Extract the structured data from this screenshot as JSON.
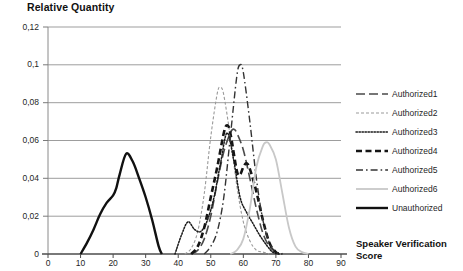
{
  "chart_data": {
    "type": "line",
    "title": "",
    "ylabel": "Relative Quantity",
    "xlabel": "Speaker Verification Score",
    "xlabel_line1": "Speaker Verification",
    "xlabel_line2": "Score",
    "xlim": [
      0,
      90
    ],
    "ylim": [
      0,
      0.12
    ],
    "xticks": [
      "0",
      "10",
      "20",
      "30",
      "40",
      "50",
      "60",
      "70",
      "80",
      "90"
    ],
    "xtick_values": [
      0,
      10,
      20,
      30,
      40,
      50,
      60,
      70,
      80,
      90
    ],
    "yticks": [
      "0",
      "0,02",
      "0,04",
      "0,06",
      "0,08",
      "0,1",
      "0,12"
    ],
    "ytick_values": [
      0,
      0.02,
      0.04,
      0.06,
      0.08,
      0.1,
      0.12
    ],
    "grid": "horizontal",
    "legend_position": "right",
    "decimal_separator": ",",
    "series": [
      {
        "name": "Authorized1",
        "style": "long-dash",
        "color": "#4a4a4a",
        "width": 1.6,
        "peak_x": 57,
        "peak_y": 0.066,
        "x": [
          44,
          46,
          48,
          50,
          52,
          54,
          56,
          57,
          58,
          60,
          62,
          64,
          66,
          68,
          70,
          72
        ],
        "y": [
          0.0,
          0.002,
          0.008,
          0.02,
          0.038,
          0.054,
          0.064,
          0.066,
          0.064,
          0.055,
          0.04,
          0.024,
          0.011,
          0.004,
          0.001,
          0.0
        ]
      },
      {
        "name": "Authorized2",
        "style": "fine-dash",
        "color": "#9a9a9a",
        "width": 1.1,
        "peak_x": 53,
        "peak_y": 0.088,
        "x": [
          42,
          44,
          46,
          48,
          50,
          52,
          53,
          54,
          56,
          58,
          60,
          62,
          64,
          66,
          68
        ],
        "y": [
          0.0,
          0.003,
          0.012,
          0.032,
          0.062,
          0.085,
          0.088,
          0.084,
          0.062,
          0.036,
          0.017,
          0.007,
          0.002,
          0.001,
          0.0
        ]
      },
      {
        "name": "Authorized3",
        "style": "dotted",
        "color": "#1a1a1a",
        "width": 1.5,
        "peak_x": 55,
        "peak_y": 0.064,
        "secondary_peak_x": 43,
        "secondary_peak_y": 0.017,
        "x": [
          39,
          41,
          43,
          45,
          47,
          49,
          51,
          53,
          55,
          57,
          59,
          61,
          63,
          65,
          67,
          69,
          71
        ],
        "y": [
          0.0,
          0.01,
          0.017,
          0.013,
          0.012,
          0.018,
          0.03,
          0.048,
          0.064,
          0.05,
          0.03,
          0.022,
          0.016,
          0.01,
          0.005,
          0.001,
          0.0
        ]
      },
      {
        "name": "Authorized4",
        "style": "bold-dash",
        "color": "#151515",
        "width": 2.6,
        "peak_x": 55,
        "peak_y": 0.068,
        "x": [
          44,
          46,
          48,
          50,
          52,
          54,
          55,
          56,
          58,
          59,
          60,
          61,
          62,
          64,
          66,
          68,
          70,
          72
        ],
        "y": [
          0.0,
          0.004,
          0.014,
          0.03,
          0.046,
          0.064,
          0.068,
          0.064,
          0.044,
          0.042,
          0.046,
          0.048,
          0.045,
          0.033,
          0.018,
          0.006,
          0.001,
          0.0
        ]
      },
      {
        "name": "Authorized5",
        "style": "dash-dot",
        "color": "#333333",
        "width": 1.4,
        "peak_x": 59,
        "peak_y": 0.1,
        "x": [
          48,
          50,
          52,
          54,
          56,
          58,
          59,
          60,
          62,
          64,
          66,
          68,
          70,
          72
        ],
        "y": [
          0.0,
          0.004,
          0.012,
          0.03,
          0.062,
          0.094,
          0.1,
          0.096,
          0.07,
          0.04,
          0.018,
          0.006,
          0.001,
          0.0
        ]
      },
      {
        "name": "Authorized6",
        "style": "light-solid",
        "color": "#c8c8c8",
        "width": 1.8,
        "peak_x": 67,
        "peak_y": 0.059,
        "x": [
          56,
          58,
          60,
          62,
          64,
          66,
          67,
          68,
          70,
          72,
          74,
          76,
          78,
          80
        ],
        "y": [
          0.0,
          0.002,
          0.008,
          0.024,
          0.046,
          0.057,
          0.059,
          0.058,
          0.05,
          0.032,
          0.014,
          0.004,
          0.001,
          0.0
        ]
      },
      {
        "name": "Unauthorized",
        "style": "bold-solid",
        "color": "#111111",
        "width": 2.4,
        "peak_x": 24,
        "peak_y": 0.053,
        "x": [
          10,
          12,
          14,
          16,
          18,
          20,
          21,
          22,
          24,
          26,
          28,
          30,
          32,
          34,
          35
        ],
        "y": [
          0.0,
          0.006,
          0.013,
          0.021,
          0.027,
          0.031,
          0.035,
          0.042,
          0.053,
          0.049,
          0.04,
          0.03,
          0.018,
          0.004,
          0.0
        ]
      }
    ]
  },
  "legend": {
    "items": [
      {
        "label": "Authorized1"
      },
      {
        "label": "Authorized2"
      },
      {
        "label": "Authorized3"
      },
      {
        "label": "Authorized4"
      },
      {
        "label": "Authorized5"
      },
      {
        "label": "Authorized6"
      },
      {
        "label": "Unauthorized"
      }
    ]
  }
}
